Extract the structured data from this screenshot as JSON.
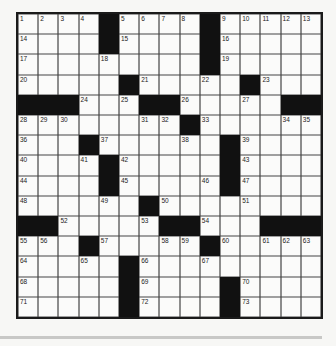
{
  "puzzle": {
    "size": 15,
    "grid": [
      ".... .... .....",
      ".... .... .....",
      "......... .....",
      "..... .... ....",
      "   ...  .....  ",
      "........ ......",
      "... ...... ....",
      ".... ..... ....",
      ".... ..... ....",
      "...... ........",
      "  ..... ...   ",
      "... ..... .....",
      "..... .........",
      "..... .... ....",
      "..... .... ...."
    ],
    "black_cells": [
      [
        0,
        4
      ],
      [
        0,
        9
      ],
      [
        1,
        4
      ],
      [
        1,
        9
      ],
      [
        2,
        9
      ],
      [
        3,
        5
      ],
      [
        3,
        11
      ],
      [
        4,
        0
      ],
      [
        4,
        1
      ],
      [
        4,
        2
      ],
      [
        4,
        6
      ],
      [
        4,
        7
      ],
      [
        4,
        13
      ],
      [
        4,
        14
      ],
      [
        5,
        8
      ],
      [
        6,
        3
      ],
      [
        6,
        10
      ],
      [
        7,
        4
      ],
      [
        7,
        10
      ],
      [
        8,
        4
      ],
      [
        8,
        10
      ],
      [
        9,
        6
      ],
      [
        10,
        0
      ],
      [
        10,
        1
      ],
      [
        10,
        7
      ],
      [
        10,
        8
      ],
      [
        10,
        12
      ],
      [
        10,
        13
      ],
      [
        10,
        14
      ],
      [
        11,
        3
      ],
      [
        11,
        9
      ],
      [
        12,
        5
      ],
      [
        13,
        5
      ],
      [
        13,
        10
      ],
      [
        14,
        5
      ],
      [
        14,
        10
      ]
    ],
    "numbers": [
      {
        "r": 0,
        "c": 0,
        "n": "1"
      },
      {
        "r": 0,
        "c": 1,
        "n": "2"
      },
      {
        "r": 0,
        "c": 2,
        "n": "3"
      },
      {
        "r": 0,
        "c": 3,
        "n": "4"
      },
      {
        "r": 0,
        "c": 5,
        "n": "5"
      },
      {
        "r": 0,
        "c": 6,
        "n": "6"
      },
      {
        "r": 0,
        "c": 7,
        "n": "7"
      },
      {
        "r": 0,
        "c": 8,
        "n": "8"
      },
      {
        "r": 0,
        "c": 10,
        "n": "9"
      },
      {
        "r": 0,
        "c": 11,
        "n": "10"
      },
      {
        "r": 0,
        "c": 12,
        "n": "11"
      },
      {
        "r": 0,
        "c": 13,
        "n": "12"
      },
      {
        "r": 0,
        "c": 14,
        "n": "13"
      },
      {
        "r": 1,
        "c": 0,
        "n": "14"
      },
      {
        "r": 1,
        "c": 5,
        "n": "15"
      },
      {
        "r": 1,
        "c": 10,
        "n": "16"
      },
      {
        "r": 2,
        "c": 0,
        "n": "17"
      },
      {
        "r": 2,
        "c": 4,
        "n": "18"
      },
      {
        "r": 2,
        "c": 10,
        "n": "19"
      },
      {
        "r": 3,
        "c": 0,
        "n": "20"
      },
      {
        "r": 3,
        "c": 6,
        "n": "21"
      },
      {
        "r": 3,
        "c": 9,
        "n": "22"
      },
      {
        "r": 3,
        "c": 12,
        "n": "23"
      },
      {
        "r": 4,
        "c": 3,
        "n": "24"
      },
      {
        "r": 4,
        "c": 5,
        "n": "25"
      },
      {
        "r": 4,
        "c": 8,
        "n": "26"
      },
      {
        "r": 4,
        "c": 11,
        "n": "27"
      },
      {
        "r": 5,
        "c": 0,
        "n": "28"
      },
      {
        "r": 5,
        "c": 1,
        "n": "29"
      },
      {
        "r": 5,
        "c": 2,
        "n": "30"
      },
      {
        "r": 5,
        "c": 6,
        "n": "31"
      },
      {
        "r": 5,
        "c": 7,
        "n": "32"
      },
      {
        "r": 5,
        "c": 9,
        "n": "33"
      },
      {
        "r": 5,
        "c": 13,
        "n": "34"
      },
      {
        "r": 5,
        "c": 14,
        "n": "35"
      },
      {
        "r": 6,
        "c": 0,
        "n": "36"
      },
      {
        "r": 6,
        "c": 4,
        "n": "37"
      },
      {
        "r": 6,
        "c": 8,
        "n": "38"
      },
      {
        "r": 6,
        "c": 11,
        "n": "39"
      },
      {
        "r": 7,
        "c": 0,
        "n": "40"
      },
      {
        "r": 7,
        "c": 3,
        "n": "41"
      },
      {
        "r": 7,
        "c": 5,
        "n": "42"
      },
      {
        "r": 7,
        "c": 11,
        "n": "43"
      },
      {
        "r": 8,
        "c": 0,
        "n": "44"
      },
      {
        "r": 8,
        "c": 5,
        "n": "45"
      },
      {
        "r": 8,
        "c": 9,
        "n": "46"
      },
      {
        "r": 8,
        "c": 11,
        "n": "47"
      },
      {
        "r": 9,
        "c": 0,
        "n": "48"
      },
      {
        "r": 9,
        "c": 4,
        "n": "49"
      },
      {
        "r": 9,
        "c": 7,
        "n": "50"
      },
      {
        "r": 9,
        "c": 11,
        "n": "51"
      },
      {
        "r": 10,
        "c": 2,
        "n": "52"
      },
      {
        "r": 10,
        "c": 6,
        "n": "53"
      },
      {
        "r": 10,
        "c": 9,
        "n": "54"
      },
      {
        "r": 11,
        "c": 0,
        "n": "55"
      },
      {
        "r": 11,
        "c": 1,
        "n": "56"
      },
      {
        "r": 11,
        "c": 4,
        "n": "57"
      },
      {
        "r": 11,
        "c": 7,
        "n": "58"
      },
      {
        "r": 11,
        "c": 8,
        "n": "59"
      },
      {
        "r": 11,
        "c": 10,
        "n": "60"
      },
      {
        "r": 11,
        "c": 12,
        "n": "61"
      },
      {
        "r": 11,
        "c": 13,
        "n": "62"
      },
      {
        "r": 11,
        "c": 14,
        "n": "63"
      },
      {
        "r": 12,
        "c": 0,
        "n": "64"
      },
      {
        "r": 12,
        "c": 3,
        "n": "65"
      },
      {
        "r": 12,
        "c": 6,
        "n": "66"
      },
      {
        "r": 12,
        "c": 9,
        "n": "67"
      },
      {
        "r": 13,
        "c": 0,
        "n": "68"
      },
      {
        "r": 13,
        "c": 6,
        "n": "69"
      },
      {
        "r": 13,
        "c": 11,
        "n": "70"
      },
      {
        "r": 14,
        "c": 0,
        "n": "71"
      },
      {
        "r": 14,
        "c": 6,
        "n": "72"
      },
      {
        "r": 14,
        "c": 11,
        "n": "73"
      }
    ]
  },
  "colors": {
    "black_square": "#111111",
    "white_square": "#fbfbfa",
    "grid_line": "#444444",
    "background": "#f7f7f5",
    "bottom_bar": "#c8c8c6"
  }
}
